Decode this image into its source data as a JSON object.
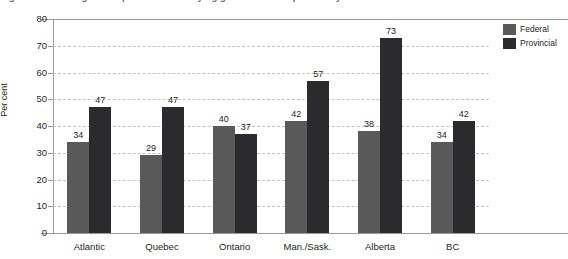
{
  "figure": {
    "title_fragment": "Figure 3  Percentage of respondents identifying government responsibility"
  },
  "chart_data": {
    "type": "bar",
    "title": "",
    "xlabel": "",
    "ylabel": "Per cent",
    "ylim": [
      0,
      80
    ],
    "yticks": [
      0,
      10,
      20,
      30,
      40,
      50,
      60,
      70,
      80
    ],
    "grid": true,
    "legend_position": "top-right",
    "categories": [
      "Atlantic",
      "Quebec",
      "Ontario",
      "Man./Sask.",
      "Alberta",
      "BC"
    ],
    "series": [
      {
        "name": "Federal",
        "color": "#59595a",
        "values": [
          34,
          29,
          40,
          42,
          38,
          34
        ]
      },
      {
        "name": "Provincial",
        "color": "#2b2b2d",
        "values": [
          47,
          47,
          37,
          57,
          73,
          42
        ]
      }
    ]
  }
}
